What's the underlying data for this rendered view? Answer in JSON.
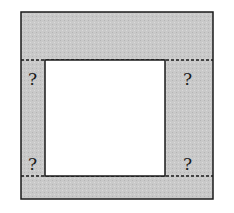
{
  "diagram": {
    "colors": {
      "background": "#ffffff",
      "shaded": "#c9c9c9",
      "inner": "#ffffff",
      "stroke": "#1a1a1a"
    },
    "outer_square": {
      "x": 21,
      "y": 12,
      "width": 192,
      "height": 187
    },
    "inner_square": {
      "x": 45,
      "y": 60,
      "width": 120,
      "height": 116
    },
    "dashed_lines": [
      {
        "y": 60,
        "x1": 21,
        "x2": 213
      },
      {
        "y": 176,
        "x1": 21,
        "x2": 213
      }
    ],
    "labels": {
      "top_left": "?",
      "top_right": "?",
      "bottom_left": "?",
      "bottom_right": "?"
    }
  }
}
